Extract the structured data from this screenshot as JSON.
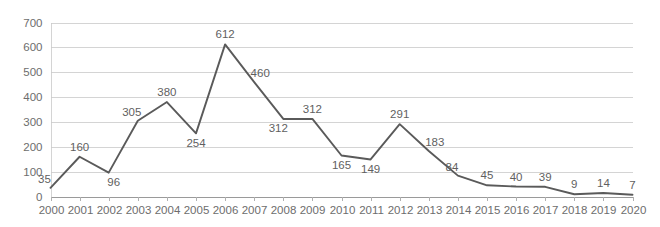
{
  "chart_data": {
    "type": "line",
    "title": "",
    "subtitle": "",
    "xlabel": "",
    "ylabel": "",
    "categories": [
      "2000",
      "2001",
      "2002",
      "2003",
      "2004",
      "2005",
      "2006",
      "2007",
      "2008",
      "2009",
      "2010",
      "2011",
      "2012",
      "2013",
      "2014",
      "2015",
      "2016",
      "2017",
      "2018",
      "2019",
      "2020"
    ],
    "values": [
      35,
      160,
      96,
      305,
      380,
      254,
      612,
      460,
      312,
      312,
      165,
      149,
      291,
      183,
      84,
      45,
      40,
      39,
      9,
      14,
      7
    ],
    "series": [
      {
        "name": "series-1",
        "values": [
          35,
          160,
          96,
          305,
          380,
          254,
          612,
          460,
          312,
          312,
          165,
          149,
          291,
          183,
          84,
          45,
          40,
          39,
          9,
          14,
          7
        ]
      }
    ],
    "data_labels": [
      "35",
      "160",
      "96",
      "305",
      "380",
      "254",
      "612",
      "460",
      "312",
      "312",
      "165",
      "149",
      "291",
      "183",
      "84",
      "45",
      "40",
      "39",
      "9",
      "14",
      "7"
    ],
    "label_positions": [
      "above-left",
      "above",
      "below-right",
      "above-left",
      "above",
      "below",
      "above",
      "above-right",
      "below-left",
      "above",
      "below",
      "below",
      "above",
      "above-right",
      "above-left",
      "above",
      "above",
      "above",
      "above",
      "above",
      "above"
    ],
    "ylim": [
      0,
      700
    ],
    "ytick_values": [
      0,
      100,
      200,
      300,
      400,
      500,
      600,
      700
    ],
    "ytick_labels": [
      "0",
      "100",
      "200",
      "300",
      "400",
      "500",
      "600",
      "700"
    ],
    "grid": true,
    "grid_axis": "y",
    "legend": false,
    "legend_position": "none",
    "colors": {
      "line": "#5a5a5a",
      "grid": "#c9c9c9",
      "axis": "#9a9a9a",
      "tick_text": "#6d6d6d",
      "label_text": "#5f5f5f",
      "background": "#ffffff"
    }
  }
}
